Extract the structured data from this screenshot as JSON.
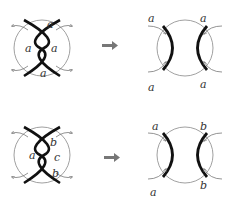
{
  "diagrams": [
    {
      "id": "top-left",
      "description": "crossing strands inside circle",
      "labels": [
        "a",
        "a",
        "a",
        "a"
      ]
    },
    {
      "id": "top-right",
      "description": "resolved strands inside circle",
      "labels": [
        "a",
        "a",
        "a",
        "a"
      ]
    },
    {
      "id": "bottom-left",
      "description": "crossing strands inside circle",
      "labels": [
        "b",
        "a",
        "c",
        "b"
      ]
    },
    {
      "id": "bottom-right",
      "description": "resolved strands inside circle",
      "labels": [
        "a",
        "b",
        "a",
        "b"
      ]
    }
  ],
  "arrows": [
    "right-arrow",
    "right-arrow"
  ],
  "colors": {
    "strand": "#111111",
    "circle": "#888888",
    "arrow": "#777777",
    "label": "#333333"
  }
}
